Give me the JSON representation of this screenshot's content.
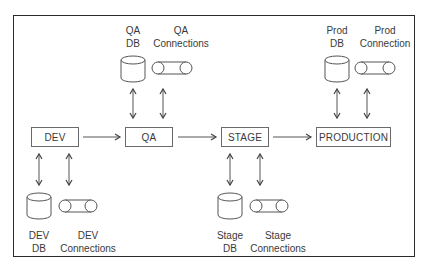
{
  "diagram": {
    "environments": [
      {
        "id": "dev",
        "label": "DEV"
      },
      {
        "id": "qa",
        "label": "QA"
      },
      {
        "id": "stage",
        "label": "STAGE"
      },
      {
        "id": "prod",
        "label": "PRODUCTION"
      }
    ],
    "resources": {
      "dev_db": {
        "line1": "DEV",
        "line2": "DB"
      },
      "dev_conn": {
        "line1": "DEV",
        "line2": "Connections"
      },
      "qa_db": {
        "line1": "QA",
        "line2": "DB"
      },
      "qa_conn": {
        "line1": "QA",
        "line2": "Connections"
      },
      "stage_db": {
        "line1": "Stage",
        "line2": "DB"
      },
      "stage_conn": {
        "line1": "Stage",
        "line2": "Connections"
      },
      "prod_db": {
        "line1": "Prod",
        "line2": "DB"
      },
      "prod_conn": {
        "line1": "Prod",
        "line2": "Connection"
      }
    },
    "flow": [
      "DEV",
      "QA",
      "STAGE",
      "PRODUCTION"
    ],
    "colors": {
      "stroke": "#555555",
      "frame": "#2a2a2a",
      "text": "#3a3a3a"
    }
  }
}
